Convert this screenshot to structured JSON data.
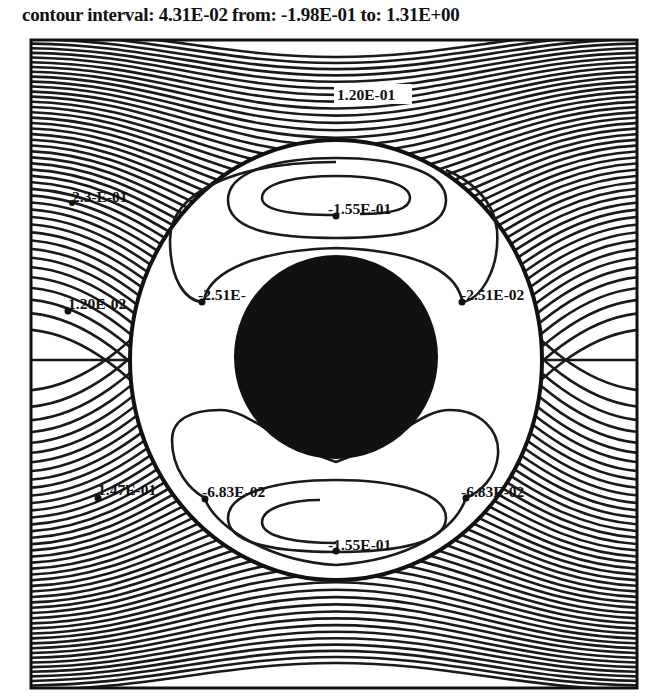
{
  "header": {
    "title": "contour interval:  4.31E-02  from: -1.98E-01 to:  1.31E+00"
  },
  "chart_data": {
    "type": "contour",
    "title": "contour interval: 4.31E-02 from: -1.98E-01 to: 1.31E+00",
    "contour_interval": 0.0431,
    "min": -0.198,
    "max": 1.31,
    "xlabel": "",
    "ylabel": "",
    "grid": false,
    "legend": null,
    "labels": [
      {
        "text": "1.20E-01",
        "x": 372,
        "y": 98,
        "boxed": true
      },
      {
        "text": "2.3-E-01",
        "x": 72,
        "y": 202
      },
      {
        "text": "-1.55E-01",
        "x": 336,
        "y": 212
      },
      {
        "text": "1.20E-02",
        "x": 68,
        "y": 311
      },
      {
        "text": "-2.51E-",
        "x": 202,
        "y": 301
      },
      {
        "text": "-2.51E-02",
        "x": 462,
        "y": 301
      },
      {
        "text": "1.47E-01",
        "x": 98,
        "y": 496
      },
      {
        "text": "-6.83E-02",
        "x": 205,
        "y": 497
      },
      {
        "text": "-6.83E-02",
        "x": 463,
        "y": 496
      },
      {
        "text": "-1.55E-01",
        "x": 336,
        "y": 550
      }
    ]
  },
  "labels": {
    "l0": "1.20E-01",
    "l1": "2.3-E-01",
    "l2": "-1.55E-01",
    "l3": "1.20E-02",
    "l4": "-2.51E-",
    "l5": "-2.51E-02",
    "l6": "1.47E-01",
    "l7": "-6.83E-02",
    "l8": "-6.83E-02",
    "l9": "-1.55E-01"
  }
}
